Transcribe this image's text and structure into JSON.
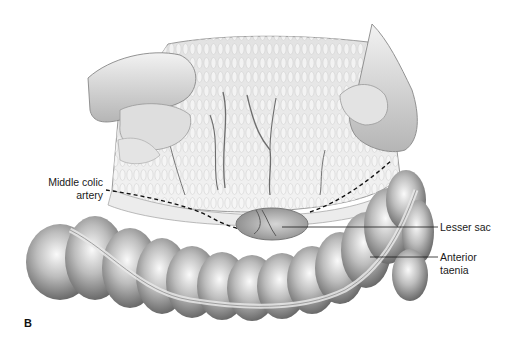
{
  "figure": {
    "panel_label": "B",
    "labels": [
      {
        "id": "middle-colic-artery",
        "text": "Middle colic\nartery"
      },
      {
        "id": "lesser-sac",
        "text": "Lesser sac"
      },
      {
        "id": "anterior-taenia",
        "text": "Anterior\ntaenia"
      }
    ],
    "colors": {
      "background": "#ffffff",
      "ink": "#1a1a1a",
      "tissue_light": "#e6e6e6",
      "tissue_mid": "#b9b9b9",
      "tissue_dark": "#6e6e6e"
    }
  }
}
